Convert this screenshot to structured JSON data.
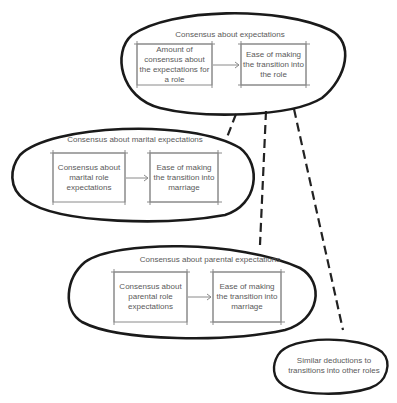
{
  "diagram": {
    "groups": [
      {
        "id": "general",
        "title": "Consensus about expectations",
        "cause": "Amount of consensus about the expectations for a role",
        "effect": "Ease of making the transition into the role"
      },
      {
        "id": "marital",
        "title": "Consensus about marital expectations",
        "cause": "Consensus about marital role expectations",
        "effect": "Ease of making the transition into marriage"
      },
      {
        "id": "parental",
        "title": "Consensus about parental expectations",
        "cause": "Consensus about parental role expectations",
        "effect": "Ease of making the transition into marriage"
      }
    ],
    "other": {
      "label": "Similar deductions to transitions into other roles"
    },
    "connectors": [
      {
        "from": "general",
        "to": "marital",
        "style": "dashed"
      },
      {
        "from": "general",
        "to": "parental",
        "style": "dashed"
      },
      {
        "from": "general",
        "to": "other",
        "style": "dashed"
      }
    ]
  }
}
